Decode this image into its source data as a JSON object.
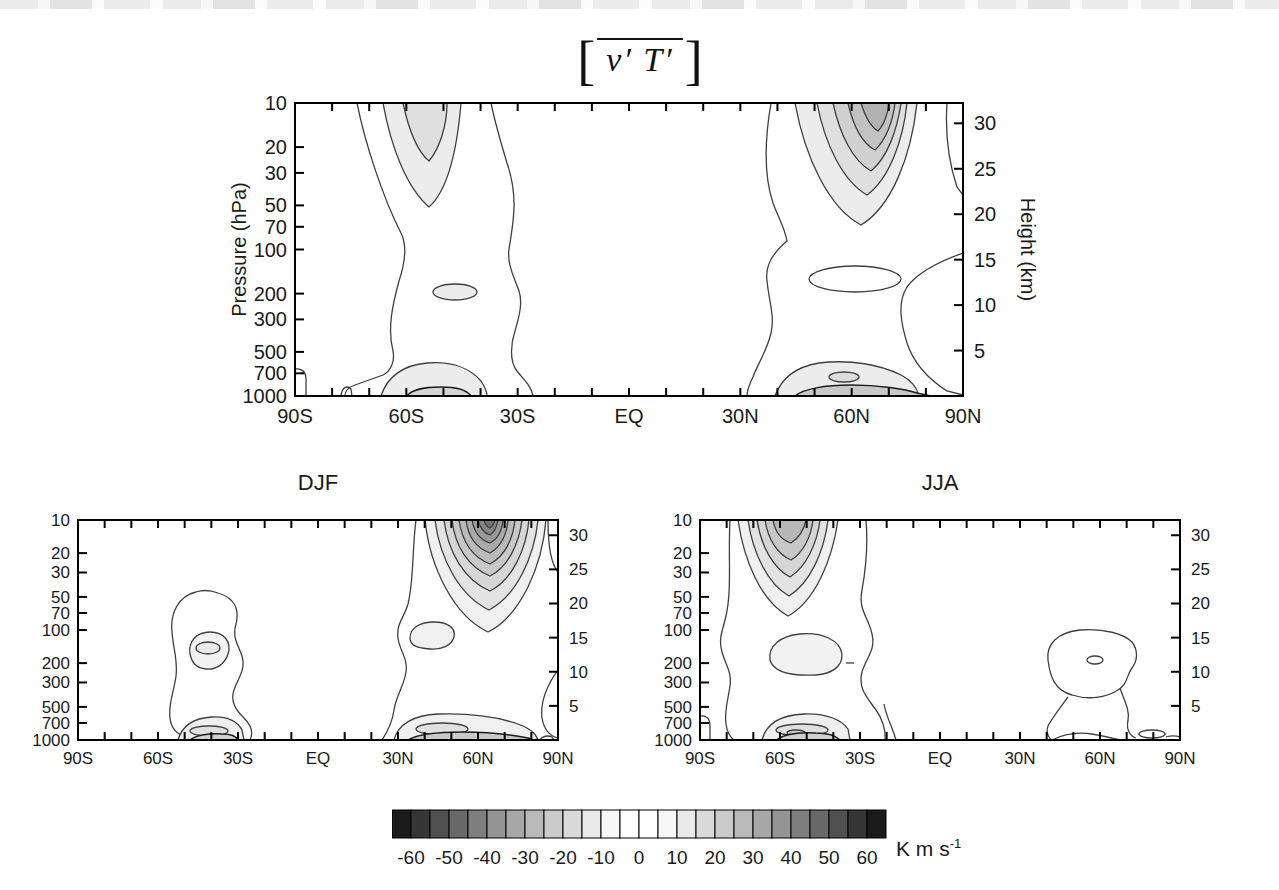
{
  "title": {
    "left_bracket": "[",
    "expression": "v′ T′",
    "right_bracket": "]"
  },
  "panels": [
    {
      "id": "annual",
      "title": "",
      "ylabel_left": "Pressure (hPa)",
      "ylabel_right": "Height (km)"
    },
    {
      "id": "djf",
      "title": "DJF"
    },
    {
      "id": "jja",
      "title": "JJA"
    }
  ],
  "axes": {
    "pressure_ticks": [
      "10",
      "20",
      "30",
      "50",
      "70",
      "100",
      "200",
      "300",
      "500",
      "700",
      "1000"
    ],
    "pressure_values": [
      10,
      20,
      30,
      50,
      70,
      100,
      200,
      300,
      500,
      700,
      1000
    ],
    "height_ticks": [
      "30",
      "25",
      "20",
      "15",
      "10",
      "5"
    ],
    "height_values": [
      30,
      25,
      20,
      15,
      10,
      5
    ],
    "lat_labels": [
      "90S",
      "60S",
      "30S",
      "EQ",
      "30N",
      "60N",
      "90N"
    ],
    "lat_values": [
      -90,
      -60,
      -30,
      0,
      30,
      60,
      90
    ],
    "lat_minor_step_deg": 10
  },
  "colorbar": {
    "min": -65,
    "max": 65,
    "cell_step": 5,
    "tick_labels": [
      "-60",
      "-50",
      "-40",
      "-30",
      "-20",
      "-10",
      "0",
      "10",
      "20",
      "30",
      "40",
      "50",
      "60"
    ],
    "cell_colors": [
      "#1b1b1b",
      "#363636",
      "#505050",
      "#686868",
      "#7f7f7f",
      "#949494",
      "#a7a7a7",
      "#b9b9b9",
      "#cacaca",
      "#dadada",
      "#e9e9e9",
      "#f7f7f7",
      "#ffffff",
      "#ffffff",
      "#f7f7f7",
      "#e9e9e9",
      "#dadada",
      "#cacaca",
      "#b9b9b9",
      "#a7a7a7",
      "#949494",
      "#7f7f7f",
      "#686868",
      "#505050",
      "#363636",
      "#1b1b1b"
    ],
    "unit_base": "K m s",
    "unit_exponent": "-1"
  },
  "chart_data": {
    "type": "contour",
    "quantity": "[v'T'] zonal-mean eddy heat flux, latitude-pressure cross sections",
    "units": "K m s-1",
    "contour_interval": 10,
    "shading": "grayscale, darker with larger |value|, white within +/-10",
    "x_axis": {
      "label": "latitude",
      "range": [
        "90S",
        "90N"
      ],
      "tick_labels": [
        "90S",
        "60S",
        "30S",
        "EQ",
        "30N",
        "60N",
        "90N"
      ],
      "minor_tick_deg": 10
    },
    "y_axis_left": {
      "label": "Pressure (hPa)",
      "scale": "log",
      "ticks": [
        10,
        20,
        30,
        50,
        70,
        100,
        200,
        300,
        500,
        700,
        1000
      ]
    },
    "y_axis_right": {
      "label": "Height (km)",
      "ticks": [
        5,
        10,
        15,
        20,
        25,
        30
      ]
    },
    "panels": [
      {
        "name": "annual",
        "title": "[v' T']",
        "features": [
          {
            "region": "NH upper-stratosphere maximum",
            "center_lat": "65N",
            "center_level_hPa": 10,
            "approx_extreme": 60
          },
          {
            "region": "SH upper-stratosphere maximum",
            "center_lat": "57S",
            "center_level_hPa": 10,
            "approx_extreme": -30
          },
          {
            "region": "NH closed contour near tropopause",
            "center_lat": "53N",
            "center_level_hPa": 200,
            "approx_extreme": 20
          },
          {
            "region": "SH closed contour near tropopause",
            "center_lat": "47S",
            "center_level_hPa": 200,
            "approx_extreme": -20
          },
          {
            "region": "NH near-surface maximum",
            "center_lat": "58N",
            "center_level_hPa": 900,
            "approx_extreme": 40
          },
          {
            "region": "SH near-surface maximum",
            "center_lat": "55S",
            "center_level_hPa": 900,
            "approx_extreme": -30
          }
        ]
      },
      {
        "name": "DJF",
        "features": [
          {
            "region": "NH upper-stratosphere maximum (winter)",
            "center_lat": "63N",
            "center_level_hPa": 10,
            "approx_extreme": 90
          },
          {
            "region": "NH closed contour near 150 hPa",
            "center_lat": "43N",
            "center_level_hPa": 150,
            "approx_extreme": 20
          },
          {
            "region": "NH near-surface maximum",
            "center_lat": "47N",
            "center_level_hPa": 900,
            "approx_extreme": 40
          },
          {
            "region": "SH midlatitude blob 70-400 hPa",
            "center_lat": "45S",
            "center_level_hPa": 200,
            "approx_extreme": -30
          },
          {
            "region": "SH near-surface maximum",
            "center_lat": "48S",
            "center_level_hPa": 900,
            "approx_extreme": -30
          }
        ]
      },
      {
        "name": "JJA",
        "features": [
          {
            "region": "SH upper-stratosphere maximum (winter)",
            "center_lat": "58S",
            "center_level_hPa": 10,
            "approx_extreme": -60
          },
          {
            "region": "SH mid-troposphere closed contour",
            "center_lat": "50S",
            "center_level_hPa": 200,
            "approx_extreme": -20
          },
          {
            "region": "SH near-surface maximum",
            "center_lat": "55S",
            "center_level_hPa": 900,
            "approx_extreme": -40
          },
          {
            "region": "NH closed contour near 200 hPa",
            "center_lat": "55N",
            "center_level_hPa": 200,
            "approx_extreme": 20
          },
          {
            "region": "NH weak near-surface contours",
            "center_lat": "65N",
            "center_level_hPa": 950,
            "approx_extreme": 20
          }
        ]
      }
    ]
  }
}
